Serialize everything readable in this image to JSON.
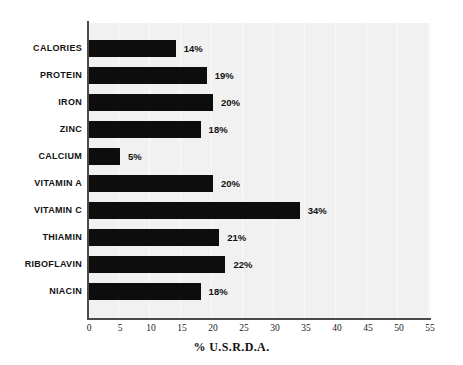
{
  "chart_data": {
    "type": "bar",
    "orientation": "horizontal",
    "title": "",
    "xlabel": "% U.S.R.D.A.",
    "ylabel": "",
    "xlim": [
      0,
      55
    ],
    "xticks": [
      0,
      5,
      10,
      15,
      20,
      25,
      30,
      35,
      40,
      45,
      50,
      55
    ],
    "xtick_labels": [
      "0",
      "5",
      "10",
      "15",
      "20",
      "25",
      "30",
      "35",
      "40",
      "45",
      "50",
      "55"
    ],
    "grid": true,
    "legend": "none",
    "categories": [
      "CALORIES",
      "PROTEIN",
      "IRON",
      "ZINC",
      "CALCIUM",
      "VITAMIN A",
      "VITAMIN C",
      "THIAMIN",
      "RIBOFLAVIN",
      "NIACIN"
    ],
    "values": [
      14,
      19,
      20,
      18,
      5,
      20,
      34,
      21,
      22,
      18
    ],
    "value_labels": [
      "14%",
      "19%",
      "20%",
      "18%",
      "5%",
      "20%",
      "34%",
      "21%",
      "22%",
      "18%"
    ],
    "bar_color": "#0d0d0d",
    "plot_background": "#f1f1f1",
    "page_background": "#ffffff",
    "axis_color": "#4a4a4a"
  }
}
